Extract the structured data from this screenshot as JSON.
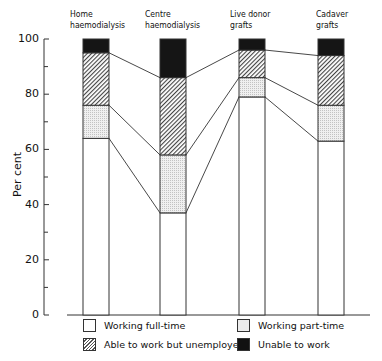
{
  "chart_data": {
    "type": "bar",
    "stacked": true,
    "title": "",
    "xlabel": "",
    "ylabel": "Per cent",
    "ylim": [
      0,
      100
    ],
    "yticks": [
      0,
      20,
      40,
      60,
      80,
      100
    ],
    "grid": false,
    "categories": [
      {
        "line1": "Home",
        "line2": "haemodialysis"
      },
      {
        "line1": "Centre",
        "line2": "haemodialysis"
      },
      {
        "line1": "Live donor",
        "line2": "grafts"
      },
      {
        "line1": "Cadaver",
        "line2": "grafts"
      }
    ],
    "series": [
      {
        "name": "Working full-time",
        "pattern": "white",
        "values": [
          64,
          37,
          79,
          63
        ]
      },
      {
        "name": "Working part-time",
        "pattern": "dotted",
        "values": [
          12,
          21,
          7,
          13
        ]
      },
      {
        "name": "Able to work but unemployed",
        "pattern": "hatched",
        "values": [
          19,
          28,
          10,
          18
        ]
      },
      {
        "name": "Unable to work",
        "pattern": "black",
        "values": [
          5,
          14,
          4,
          6
        ]
      }
    ],
    "legend_position": "bottom",
    "connecting_lines": true
  },
  "legend": [
    {
      "label": "Working full-time",
      "swatch": "sw-full"
    },
    {
      "label": "Working part-time",
      "swatch": "sw-part"
    },
    {
      "label": "Able to work but unemployed",
      "swatch": "sw-unemp"
    },
    {
      "label": "Unable to work",
      "swatch": "sw-unable"
    }
  ]
}
